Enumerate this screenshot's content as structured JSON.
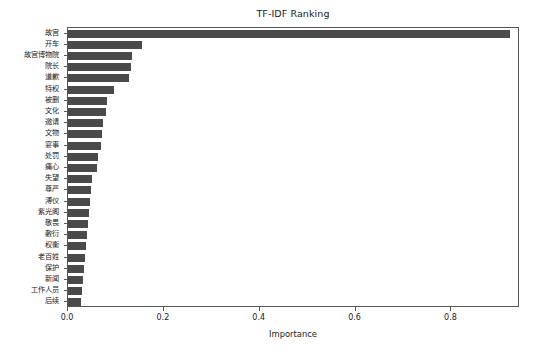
{
  "chart_data": {
    "type": "bar",
    "orientation": "horizontal",
    "title": "TF-IDF Ranking",
    "xlabel": "Importance",
    "ylabel": "",
    "xlim": [
      0.0,
      0.943
    ],
    "grid": false,
    "legend": null,
    "bar_color": "#4a4a4a",
    "xticks": [
      "0.0",
      "0.2",
      "0.4",
      "0.6",
      "0.8"
    ],
    "xtick_values": [
      0.0,
      0.2,
      0.4,
      0.6,
      0.8
    ],
    "categories": [
      "故宫",
      "开车",
      "故宫博物院",
      "院长",
      "道歉",
      "特权",
      "被删",
      "文化",
      "邀请",
      "文物",
      "宴事",
      "处罚",
      "痛心",
      "失望",
      "尊严",
      "溥仪",
      "紫光阁",
      "敬畏",
      "敷衍",
      "权衡",
      "老百姓",
      "保护",
      "新闻",
      "工作人员",
      "后续"
    ],
    "values": [
      0.923,
      0.155,
      0.133,
      0.131,
      0.127,
      0.095,
      0.082,
      0.08,
      0.074,
      0.07,
      0.068,
      0.062,
      0.06,
      0.05,
      0.048,
      0.045,
      0.043,
      0.041,
      0.04,
      0.038,
      0.035,
      0.033,
      0.032,
      0.03,
      0.028
    ]
  }
}
